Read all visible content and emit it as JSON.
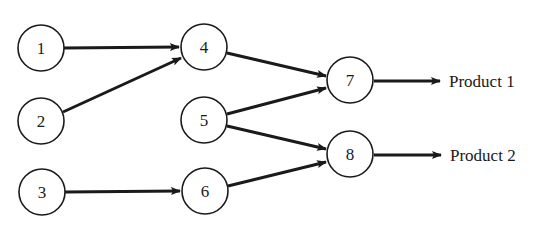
{
  "diagram": {
    "type": "directed-flow-network",
    "nodes": [
      {
        "id": "1",
        "label": "1",
        "cx": 41,
        "cy": 48
      },
      {
        "id": "2",
        "label": "2",
        "cx": 41,
        "cy": 121
      },
      {
        "id": "3",
        "label": "3",
        "cx": 42,
        "cy": 192
      },
      {
        "id": "4",
        "label": "4",
        "cx": 204,
        "cy": 47
      },
      {
        "id": "5",
        "label": "5",
        "cx": 204,
        "cy": 120
      },
      {
        "id": "6",
        "label": "6",
        "cx": 205,
        "cy": 191
      },
      {
        "id": "7",
        "label": "7",
        "cx": 350,
        "cy": 80
      },
      {
        "id": "8",
        "label": "8",
        "cx": 350,
        "cy": 154
      }
    ],
    "edges": [
      {
        "from": "1",
        "to": "4"
      },
      {
        "from": "2",
        "to": "4"
      },
      {
        "from": "3",
        "to": "6"
      },
      {
        "from": "4",
        "to": "7"
      },
      {
        "from": "5",
        "to": "7"
      },
      {
        "from": "5",
        "to": "8"
      },
      {
        "from": "6",
        "to": "8"
      },
      {
        "from": "7",
        "to": "product-1"
      },
      {
        "from": "8",
        "to": "product-2"
      }
    ],
    "outputs": [
      {
        "id": "product-1",
        "label": "Product 1",
        "from": "7"
      },
      {
        "id": "product-2",
        "label": "Product 2",
        "from": "8"
      }
    ]
  }
}
